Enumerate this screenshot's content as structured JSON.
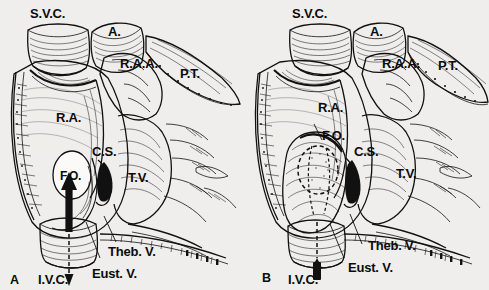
{
  "figure": {
    "type": "anatomical-line-drawing",
    "background_color": "#efeeec",
    "ink_color": "#111111"
  },
  "panels": [
    {
      "id": "A",
      "letter": "A",
      "labels": {
        "svc": "S.V.C.",
        "aorta": "A.",
        "raa": "R.A.A.",
        "pt": "P.T.",
        "ra": "R.A.",
        "fo": "F.O.",
        "cs": "C.S.",
        "tv": "T.V.",
        "theb": "Theb. V.",
        "eust": "Eust. V.",
        "ivc": "I.V.C."
      },
      "flow_arrow": {
        "style": "long-solid-up",
        "description": "bold upward arrow from I.V.C. toward F.O.",
        "dashed_tail": true
      },
      "fossa_ovalis": {
        "style": "open-oval",
        "filled": false
      }
    },
    {
      "id": "B",
      "letter": "B",
      "labels": {
        "svc": "S.V.C.",
        "aorta": "A.",
        "raa": "R.A.A.",
        "pt": "P.T.",
        "ra": "R.A.",
        "fo": "F.O.",
        "cs": "C.S.",
        "tv": "T.V.",
        "theb": "Theb. V.",
        "eust": "Eust. V.",
        "ivc": "I.V.C."
      },
      "flow_arrow": {
        "style": "short-blunt-stub",
        "description": "short blunt arrow at I.V.C.",
        "dashed_tail": true
      },
      "fossa_ovalis": {
        "style": "dashed-outline-bulge",
        "filled": false
      }
    }
  ],
  "abbreviations": {
    "S.V.C.": "superior vena cava",
    "A.": "aorta",
    "R.A.A.": "right atrial appendage",
    "P.T.": "pulmonary trunk",
    "R.A.": "right atrium",
    "F.O.": "fossa ovalis",
    "C.S.": "coronary sinus",
    "T.V.": "tricuspid valve",
    "Theb. V.": "Thebesian valve",
    "Eust. V.": "Eustachian valve",
    "I.V.C.": "inferior vena cava"
  }
}
